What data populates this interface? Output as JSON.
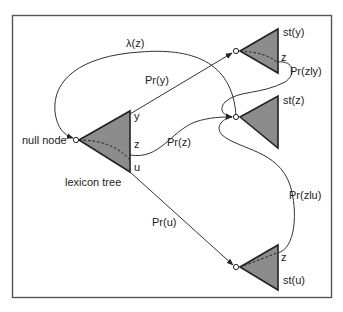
{
  "diagram": {
    "nodes": {
      "null_node": "null node",
      "lexicon_tree": "lexicon tree",
      "st_y": "st(y)",
      "st_z": "st(z)",
      "st_u": "st(u)"
    },
    "branch_labels": {
      "lex_y": "y",
      "lex_z": "z",
      "lex_u": "u",
      "sty_z": "z",
      "stu_z": "z"
    },
    "edges": {
      "lambda": "λ(z)",
      "pr_y": "Pr(y)",
      "pr_z": "Pr(z)",
      "pr_u": "Pr(u)",
      "pr_z_given_y": "Pr(zly)",
      "pr_z_given_u": "Pr(zlu)"
    },
    "colors": {
      "triangle_fill": "#8c8c8c",
      "stroke": "#222222",
      "frame": "#555555"
    }
  }
}
